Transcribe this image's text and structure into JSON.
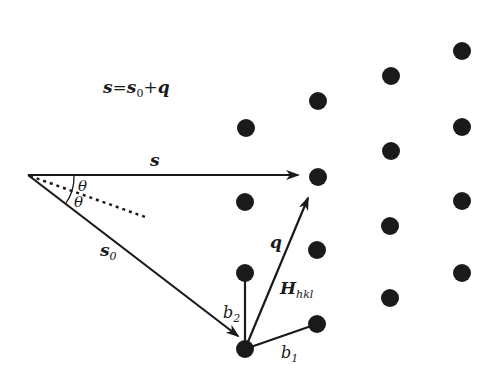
{
  "diagram": {
    "equation": {
      "s": "s",
      "eq": "=",
      "s0": "s",
      "s0_sub": "0",
      "plus": "+",
      "q": "q"
    },
    "labels": {
      "s_vector": "s",
      "s0_vector": "s",
      "s0_sub": "0",
      "q_vector": "q",
      "H": "H",
      "H_sub": "hkl",
      "theta_upper": "θ",
      "theta_lower": "θ",
      "b1": "b",
      "b1_sub": "1",
      "b2": "b",
      "b2_sub": "2"
    },
    "colors": {
      "ink": "#1a1a1a",
      "background": "#ffffff"
    },
    "lattice_points": [
      [
        462,
        51
      ],
      [
        391,
        76
      ],
      [
        318,
        101
      ],
      [
        246,
        128
      ],
      [
        462,
        127
      ],
      [
        391,
        151
      ],
      [
        318,
        177
      ],
      [
        245,
        202
      ],
      [
        462,
        201
      ],
      [
        390,
        226
      ],
      [
        317,
        250
      ],
      [
        245,
        273
      ],
      [
        462,
        273
      ],
      [
        390,
        298
      ],
      [
        317,
        324
      ],
      [
        245,
        349
      ]
    ]
  }
}
